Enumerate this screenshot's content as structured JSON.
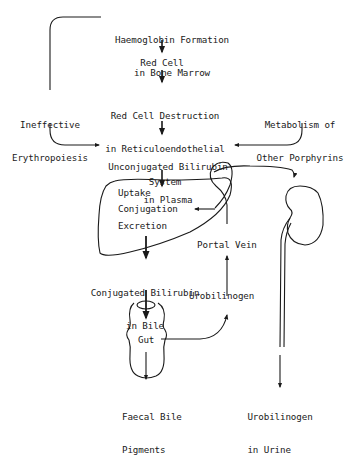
{
  "diagram": {
    "nodes": {
      "haemoglobin": {
        "line1": "Haemoglobin Formation",
        "line2": "in Bone Marrow"
      },
      "red_cell": {
        "label": "Red Cell"
      },
      "destruction": {
        "line1": "Red Cell Destruction",
        "line2": "in Reticuloendothelial",
        "line3": "System"
      },
      "ineffective": {
        "line1": "Ineffective",
        "line2": "Erythropoiesis"
      },
      "porphyrins": {
        "line1": "Metabolism of",
        "line2": "Other Porphyrins"
      },
      "unconjugated": {
        "line1": "Unconjugated Bilirubin",
        "line2": "in Plasma"
      },
      "liver": {
        "uptake": "Uptake",
        "conjugation": "Conjugation",
        "excretion": "Excretion"
      },
      "portal_vein": {
        "label": "Portal Vein"
      },
      "conjugated": {
        "line1": "Conjugated Bilirubin",
        "line2": "in Bile"
      },
      "urobilinogen": {
        "label": "Urobilinogen"
      },
      "gut": {
        "label": "Gut"
      },
      "faecal": {
        "line1": "Faecal Bile",
        "line2": "Pigments"
      },
      "urine": {
        "line1": "Urobilinogen",
        "line2": "in Urine"
      }
    },
    "icons": [
      "liver-outline",
      "kidney-outline",
      "gut-outline",
      "ureter"
    ]
  }
}
